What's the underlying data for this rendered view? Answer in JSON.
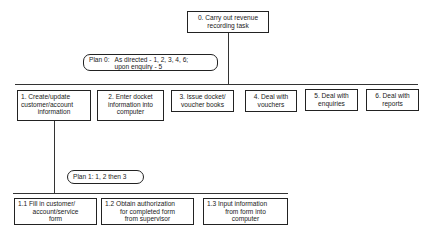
{
  "root": {
    "label": "0.  Carry out revenue",
    "label_line2": "recording task"
  },
  "plan0": {
    "prefix": "Plan 0:",
    "line1": "As directed - 1, 2, 3, 4, 6;",
    "line2": "upon enquiry - 5"
  },
  "level1": [
    {
      "id": "1",
      "lines": [
        "1. Create/update",
        "customer/account",
        "information"
      ]
    },
    {
      "id": "2",
      "lines": [
        "2.   Enter docket",
        "information into",
        "computer"
      ]
    },
    {
      "id": "3",
      "lines": [
        "3.  Issue docket/",
        "voucher books"
      ]
    },
    {
      "id": "4",
      "lines": [
        "4.  Deal with",
        "vouchers"
      ]
    },
    {
      "id": "5",
      "lines": [
        "5.  Deal with",
        "enquiries"
      ]
    },
    {
      "id": "6",
      "lines": [
        "6.  Deal with",
        "reports"
      ]
    }
  ],
  "plan1": {
    "label": "Plan 1: 1, 2 then 3"
  },
  "level2": [
    {
      "id": "1.1",
      "lines": [
        "1.1    Fill in customer/",
        "account/service",
        "form"
      ]
    },
    {
      "id": "1.2",
      "lines": [
        "1.2   Obtain authorization",
        "for completed form",
        "from supervisor"
      ]
    },
    {
      "id": "1.3",
      "lines": [
        "1.3   Input information",
        "from form into",
        "computer"
      ]
    }
  ]
}
